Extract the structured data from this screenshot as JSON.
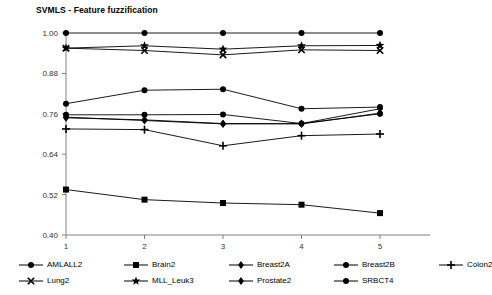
{
  "chart_data": {
    "type": "line",
    "title": "SVMLS - Feature fuzzification",
    "xlabel": "",
    "ylabel": "",
    "x": [
      1,
      2,
      3,
      4,
      5
    ],
    "categories": [
      "1",
      "2",
      "3",
      "4",
      "5"
    ],
    "xtick_labels": [
      "1",
      "2",
      "3",
      "4",
      "5"
    ],
    "ytick_labels": [
      "1.00",
      "0.88",
      "0.76",
      "0.64",
      "0.52",
      "0.40"
    ],
    "ytick_values": [
      1.0,
      0.88,
      0.76,
      0.64,
      0.52,
      0.4
    ],
    "ylim": [
      0.4,
      1.0
    ],
    "xlim": [
      1,
      5
    ],
    "grid": false,
    "legend_position": "bottom",
    "series": [
      {
        "name": "AMLALL2",
        "marker": "circle",
        "values": [
          0.757,
          0.757,
          0.758,
          0.731,
          0.76
        ]
      },
      {
        "name": "Brain2",
        "marker": "square",
        "values": [
          0.535,
          0.505,
          0.495,
          0.49,
          0.465
        ]
      },
      {
        "name": "Breast2A",
        "marker": "diamond",
        "values": [
          0.75,
          0.74,
          0.73,
          0.731,
          0.775
        ]
      },
      {
        "name": "Breast2B",
        "marker": "circle",
        "values": [
          0.79,
          0.83,
          0.833,
          0.775,
          0.78
        ]
      },
      {
        "name": "Colon2",
        "marker": "plus",
        "values": [
          0.715,
          0.713,
          0.665,
          0.695,
          0.7
        ]
      },
      {
        "name": "Lung2",
        "marker": "cross",
        "values": [
          0.955,
          0.948,
          0.935,
          0.95,
          0.948
        ]
      },
      {
        "name": "MLL_Leuk3",
        "marker": "star",
        "values": [
          0.955,
          0.962,
          0.952,
          0.962,
          0.963
        ]
      },
      {
        "name": "Prostate2",
        "marker": "diamond",
        "values": [
          0.748,
          0.742,
          0.731,
          0.73,
          0.762
        ]
      },
      {
        "name": "SRBCT4",
        "marker": "circle",
        "values": [
          1.0,
          1.0,
          1.0,
          1.0,
          1.0
        ]
      }
    ],
    "legend_rows": [
      [
        "AMLALL2",
        "Brain2",
        "Breast2A",
        "Breast2B",
        "Colon2"
      ],
      [
        "Lung2",
        "MLL_Leuk3",
        "Prostate2",
        "SRBCT4"
      ]
    ],
    "colors": {
      "line": "#000000",
      "axis": "#808080",
      "tick_text": "#333333",
      "background": "#ffffff"
    }
  }
}
